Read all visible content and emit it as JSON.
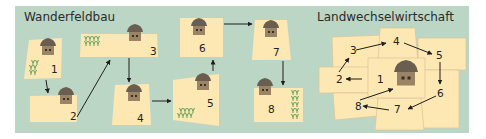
{
  "colors": {
    "panel_bg": "#bcd6c6",
    "field_fill": "#fde7b3",
    "field_stroke": "#d8c49a",
    "hut_roof": "#6a5e50",
    "hut_wall": "#9b8366",
    "crop": "#5e9e5a",
    "arrow": "#1e1e1e"
  },
  "diagrams": [
    {
      "title": "Wanderfeldbau",
      "fields": [
        {
          "id": "1",
          "label": "1",
          "hut": true,
          "crops": true
        },
        {
          "id": "2",
          "label": "2",
          "hut": true,
          "crops": false
        },
        {
          "id": "3",
          "label": "3",
          "hut": true,
          "crops": true
        },
        {
          "id": "4",
          "label": "4",
          "hut": true,
          "crops": false
        },
        {
          "id": "5",
          "label": "5",
          "hut": true,
          "crops": true
        },
        {
          "id": "6",
          "label": "6",
          "hut": true,
          "crops": false
        },
        {
          "id": "7",
          "label": "7",
          "hut": true,
          "crops": false
        },
        {
          "id": "8",
          "label": "8",
          "hut": true,
          "crops": true
        }
      ],
      "sequence": [
        "1",
        "2",
        "3",
        "4",
        "5",
        "6",
        "7",
        "8"
      ]
    },
    {
      "title": "Landwechselwirtschaft",
      "center_hut": true,
      "fields": [
        {
          "id": "1",
          "label": "1"
        },
        {
          "id": "2",
          "label": "2"
        },
        {
          "id": "3",
          "label": "3"
        },
        {
          "id": "4",
          "label": "4"
        },
        {
          "id": "5",
          "label": "5"
        },
        {
          "id": "6",
          "label": "6"
        },
        {
          "id": "7",
          "label": "7"
        },
        {
          "id": "8",
          "label": "8"
        }
      ],
      "sequence": [
        "1",
        "2",
        "3",
        "4",
        "5",
        "6",
        "7",
        "8",
        "1"
      ]
    }
  ]
}
